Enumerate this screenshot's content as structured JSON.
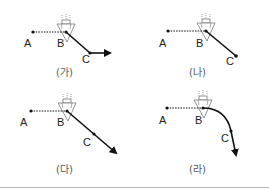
{
  "panels": [
    {
      "id": "ga",
      "caption": "(가)",
      "labels": {
        "a": "A",
        "b": "B",
        "c": "C"
      },
      "path_type": "bent-line-then-horizontal"
    },
    {
      "id": "na",
      "caption": "(나)",
      "labels": {
        "a": "A",
        "b": "B",
        "c": "C"
      },
      "path_type": "straight-line-ending-at-C"
    },
    {
      "id": "da",
      "caption": "(다)",
      "labels": {
        "a": "A",
        "b": "B",
        "c": "C"
      },
      "path_type": "straight-line-through-C-with-arrow"
    },
    {
      "id": "ra",
      "caption": "(라)",
      "labels": {
        "a": "A",
        "b": "B",
        "c": "C"
      },
      "path_type": "curved-path-through-C-with-arrow"
    }
  ],
  "icons": {
    "object": "nozzle-triangle-icon"
  },
  "colors": {
    "line": "#111111",
    "icon": "#777777",
    "divider": "#b5b5b5",
    "caption": "#555555"
  }
}
